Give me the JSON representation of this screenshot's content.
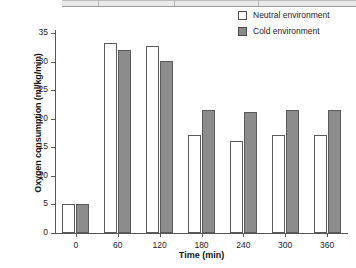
{
  "chart_data": {
    "type": "bar",
    "title": "",
    "xlabel": "Time (min)",
    "ylabel": "Oxygen consumption (ml/kg/min)",
    "categories": [
      "0",
      "60",
      "120",
      "180",
      "240",
      "300",
      "360"
    ],
    "series": [
      {
        "name": "Neutral environment",
        "color": "#ffffff",
        "values": [
          5.0,
          33.2,
          32.7,
          17.2,
          16.1,
          17.2,
          17.2
        ]
      },
      {
        "name": "Cold environment",
        "color": "#8c8c8c",
        "values": [
          5.0,
          32.1,
          30.1,
          21.6,
          21.1,
          21.6,
          21.6
        ]
      }
    ],
    "ylim": [
      0,
      35
    ],
    "yticks": [
      "0",
      "5",
      "10",
      "15",
      "20",
      "25",
      "30",
      "35"
    ],
    "grid": false,
    "legend_position": "top-right"
  },
  "legend": {
    "items": [
      {
        "label": "Neutral environment",
        "swatch": "open-square-icon"
      },
      {
        "label": "Cold environment",
        "swatch": "filled-square-icon"
      }
    ]
  }
}
